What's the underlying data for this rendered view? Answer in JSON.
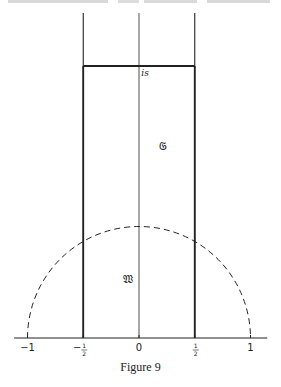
{
  "figure": {
    "caption": "Figure 9",
    "region_labels": {
      "top_point": "is",
      "upper_region": "𝔊",
      "lower_region": "𝔚"
    },
    "x_axis": {
      "ticks": [
        {
          "value": -1,
          "label": "−1"
        },
        {
          "value": -0.5,
          "label": "−",
          "num": "1",
          "den": "2"
        },
        {
          "value": 0,
          "label": "0"
        },
        {
          "value": 0.5,
          "label": "",
          "num": "1",
          "den": "2"
        },
        {
          "value": 1,
          "label": "1"
        }
      ],
      "range": [
        -1.12,
        1.15
      ]
    },
    "vertical_lines_x": [
      -0.5,
      0,
      0.5
    ],
    "dashed_circle": {
      "center": 0,
      "radius": 1
    },
    "colors": {
      "ink": "#222222",
      "background": "#ffffff"
    }
  }
}
